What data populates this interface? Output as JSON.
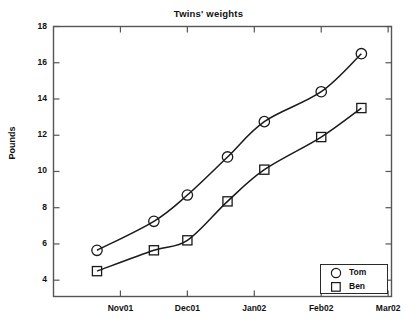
{
  "chart_data": {
    "type": "line",
    "title": "Twins' weights",
    "xlabel": "",
    "ylabel": "Pounds",
    "ylim": [
      3.1,
      18
    ],
    "yticks": [
      4,
      6,
      8,
      10,
      12,
      14,
      16,
      18
    ],
    "xtick_labels": [
      "Nov01",
      "Dec01",
      "Jan02",
      "Feb02",
      "Mar02"
    ],
    "x": [
      0.65,
      1.5,
      2.0,
      2.6,
      3.15,
      4.0,
      4.6
    ],
    "xlim": [
      0.0,
      5.05
    ],
    "grid": false,
    "legend_position": "lower right",
    "series": [
      {
        "name": "Tom",
        "marker": "circle",
        "color": "#1a1a1a",
        "values": [
          5.65,
          7.25,
          8.7,
          10.8,
          12.75,
          14.4,
          16.5
        ]
      },
      {
        "name": "Ben",
        "marker": "square",
        "color": "#1a1a1a",
        "values": [
          4.5,
          5.65,
          6.2,
          8.35,
          10.1,
          11.9,
          13.5
        ]
      }
    ]
  },
  "legend": {
    "items": [
      {
        "label": "Tom",
        "marker": "circle"
      },
      {
        "label": "Ben",
        "marker": "square"
      }
    ]
  },
  "axes": {
    "y_tick_texts": [
      "18",
      "16",
      "14",
      "12",
      "10",
      "8",
      "6",
      "4"
    ],
    "x_tick_texts": [
      "Nov01",
      "Dec01",
      "Jan02",
      "Feb02",
      "Mar02"
    ]
  }
}
